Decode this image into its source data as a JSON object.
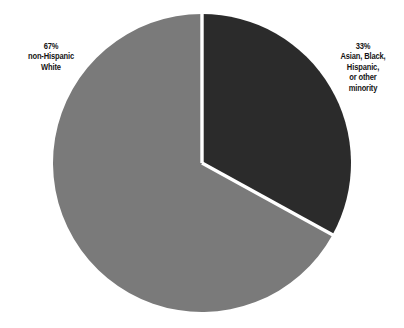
{
  "chart_data": {
    "type": "pie",
    "title": "",
    "subtitle": "",
    "xlabel": "",
    "ylabel": "",
    "grid": false,
    "legend_position": "outside-labels",
    "start_angle_deg": 0,
    "direction": "clockwise",
    "categories": [
      "non-Hispanic White",
      "Asian, Black, Hispanic, or other minority"
    ],
    "values": [
      67,
      33
    ],
    "value_unit": "%",
    "slices": [
      {
        "name": "non-Hispanic White",
        "value": 67,
        "percent_label": "67%",
        "label_lines": [
          "non-Hispanic",
          "White"
        ],
        "color": "#7a7a7a",
        "label_side": "left"
      },
      {
        "name": "Asian, Black, Hispanic, or other minority",
        "value": 33,
        "percent_label": "33%",
        "label_lines": [
          "Asian, Black,",
          "Hispanic,",
          "or other",
          "minority"
        ],
        "color": "#2b2b2b",
        "label_side": "right"
      }
    ],
    "separator_color": "#ffffff",
    "background_color": "#ffffff",
    "text_color": "#141414"
  },
  "labels": {
    "left": {
      "percent": "67%",
      "line1": "non-Hispanic",
      "line2": "White"
    },
    "right": {
      "percent": "33%",
      "line1": "Asian, Black,",
      "line2": "Hispanic,",
      "line3": "or other",
      "line4": "minority"
    }
  },
  "geometry": {
    "center_x": 202,
    "center_y": 163,
    "radius": 149,
    "separator_width": 3
  }
}
